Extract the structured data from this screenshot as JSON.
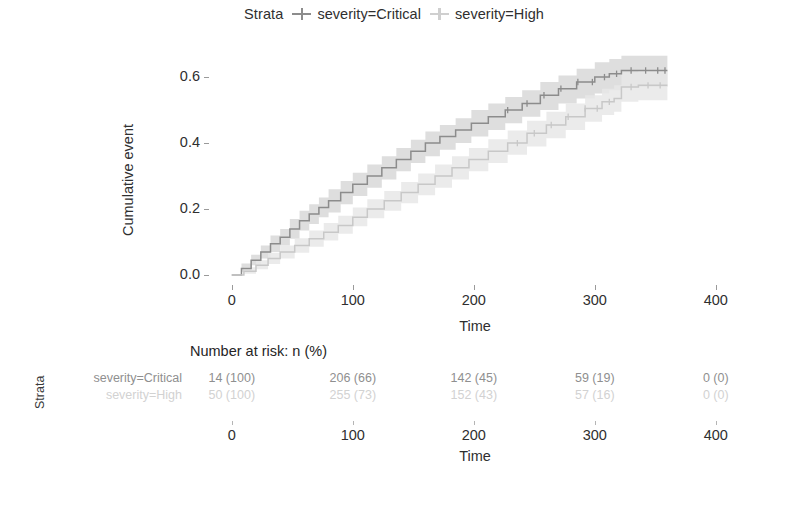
{
  "legend": {
    "title": "Strata",
    "entries": [
      {
        "label": "severity=Critical",
        "key_icon": "plus-line-marker-icon",
        "color": "#8c8c8c"
      },
      {
        "label": "severity=High",
        "key_icon": "plus-line-marker-icon",
        "color": "#cfcfcf"
      }
    ]
  },
  "chart_data": {
    "type": "line",
    "title": "",
    "xlabel": "Time",
    "ylabel": "Cumulative event",
    "xlim": [
      -18,
      420
    ],
    "ylim": [
      -0.03,
      0.67
    ],
    "xticks": [
      0,
      100,
      200,
      300,
      400
    ],
    "yticks": [
      "0.0",
      "0.2",
      "0.4",
      "0.6"
    ],
    "ytick_values": [
      0.0,
      0.2,
      0.4,
      0.6
    ],
    "grid": false,
    "legend_position": "top-center",
    "step_type": "hv",
    "confidence_band": true,
    "series": [
      {
        "name": "severity=Critical",
        "color": "#8c8c8c",
        "band_color": "#d8d8d8",
        "x": [
          0,
          8,
          16,
          24,
          32,
          40,
          48,
          56,
          64,
          72,
          80,
          90,
          100,
          112,
          124,
          136,
          148,
          160,
          172,
          185,
          198,
          212,
          226,
          240,
          255,
          270,
          285,
          300,
          312,
          322,
          335,
          348,
          360
        ],
        "y": [
          0.0,
          0.02,
          0.045,
          0.07,
          0.095,
          0.115,
          0.14,
          0.165,
          0.185,
          0.205,
          0.225,
          0.25,
          0.275,
          0.3,
          0.325,
          0.35,
          0.375,
          0.4,
          0.42,
          0.44,
          0.46,
          0.48,
          0.5,
          0.52,
          0.545,
          0.565,
          0.585,
          0.6,
          0.61,
          0.62,
          0.62,
          0.62,
          0.62
        ],
        "lower": [
          0.0,
          0.01,
          0.03,
          0.05,
          0.07,
          0.09,
          0.11,
          0.135,
          0.155,
          0.175,
          0.19,
          0.215,
          0.24,
          0.265,
          0.29,
          0.315,
          0.34,
          0.36,
          0.38,
          0.4,
          0.42,
          0.44,
          0.46,
          0.48,
          0.5,
          0.52,
          0.535,
          0.55,
          0.56,
          0.57,
          0.57,
          0.57,
          0.57
        ],
        "upper": [
          0.0,
          0.035,
          0.062,
          0.09,
          0.12,
          0.14,
          0.17,
          0.195,
          0.215,
          0.235,
          0.26,
          0.285,
          0.31,
          0.335,
          0.36,
          0.385,
          0.41,
          0.435,
          0.455,
          0.475,
          0.5,
          0.52,
          0.54,
          0.56,
          0.585,
          0.605,
          0.625,
          0.645,
          0.655,
          0.665,
          0.665,
          0.665,
          0.665
        ],
        "censor_x": [
          228,
          244,
          258,
          272,
          286,
          298,
          308,
          318,
          330,
          342,
          352,
          358
        ]
      },
      {
        "name": "severity=High",
        "color": "#c8c8c8",
        "band_color": "#e8e8e8",
        "x": [
          0,
          10,
          20,
          30,
          40,
          52,
          64,
          76,
          88,
          100,
          112,
          126,
          140,
          154,
          168,
          182,
          196,
          212,
          228,
          244,
          260,
          276,
          292,
          306,
          316,
          322,
          336,
          350,
          360
        ],
        "y": [
          0.0,
          0.012,
          0.03,
          0.05,
          0.07,
          0.09,
          0.11,
          0.13,
          0.15,
          0.175,
          0.2,
          0.225,
          0.25,
          0.275,
          0.3,
          0.325,
          0.35,
          0.375,
          0.4,
          0.43,
          0.455,
          0.48,
          0.505,
          0.525,
          0.535,
          0.57,
          0.575,
          0.575,
          0.575
        ],
        "lower": [
          0.0,
          0.004,
          0.018,
          0.034,
          0.05,
          0.068,
          0.086,
          0.105,
          0.125,
          0.148,
          0.172,
          0.195,
          0.218,
          0.242,
          0.265,
          0.29,
          0.315,
          0.34,
          0.365,
          0.39,
          0.415,
          0.44,
          0.465,
          0.485,
          0.495,
          0.525,
          0.53,
          0.53,
          0.53
        ],
        "upper": [
          0.0,
          0.024,
          0.045,
          0.068,
          0.09,
          0.112,
          0.135,
          0.158,
          0.18,
          0.205,
          0.23,
          0.255,
          0.282,
          0.308,
          0.335,
          0.36,
          0.385,
          0.412,
          0.438,
          0.468,
          0.495,
          0.52,
          0.545,
          0.565,
          0.575,
          0.615,
          0.62,
          0.62,
          0.62
        ],
        "censor_x": [
          236,
          250,
          264,
          278,
          292,
          302,
          312,
          330,
          344,
          354
        ]
      }
    ]
  },
  "risk_table": {
    "title": "Number at risk: n (%)",
    "strata_axis_label": "Strata",
    "times": [
      0,
      100,
      200,
      300,
      400
    ],
    "xlabel": "Time",
    "rows": [
      {
        "label": "severity=Critical",
        "color": "#8f8f8f",
        "values": [
          "14 (100)",
          "206 (66)",
          "142 (45)",
          "59 (19)",
          "0 (0)"
        ]
      },
      {
        "label": "severity=High",
        "color": "#d2d2d2",
        "values": [
          "50 (100)",
          "255 (73)",
          "152 (43)",
          "57 (16)",
          "0 (0)"
        ]
      }
    ]
  }
}
